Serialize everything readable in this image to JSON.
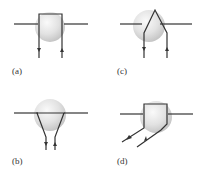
{
  "figure": {
    "panels": [
      {
        "id": "a",
        "label": "(a)",
        "shape": "square-loop",
        "lead_direction": "down"
      },
      {
        "id": "c",
        "label": "(c)",
        "shape": "triangle-apex-up",
        "lead_direction": "down"
      },
      {
        "id": "b",
        "label": "(b)",
        "shape": "inverted-triangle",
        "lead_direction": "down"
      },
      {
        "id": "d",
        "label": "(d)",
        "shape": "square-loop-diagonal",
        "lead_direction": "down-left"
      }
    ]
  },
  "colors": {
    "line": "#333333",
    "sphere_light": "#f4f4f4",
    "sphere_dark": "#c8c8c8"
  }
}
